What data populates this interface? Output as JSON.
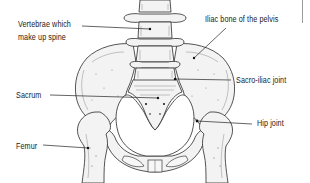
{
  "diagram": {
    "labels": [
      {
        "id": "vertebrae",
        "line1": "Vertebrae which",
        "line2": "make up spine"
      },
      {
        "id": "iliac",
        "line1": "Iliac bone of the pelvis"
      },
      {
        "id": "sacroiliac",
        "line1": "Sacro-iliac joint"
      },
      {
        "id": "sacrum",
        "line1": "Sacrum"
      },
      {
        "id": "hip",
        "line1": "Hip joint"
      },
      {
        "id": "femur",
        "line1": "Femur"
      }
    ]
  },
  "colors": {
    "background": "#ffffff",
    "ink": "#1a1a1a",
    "bone_fill": "#f3f3f3",
    "edge_line": "#9a9a9a"
  }
}
